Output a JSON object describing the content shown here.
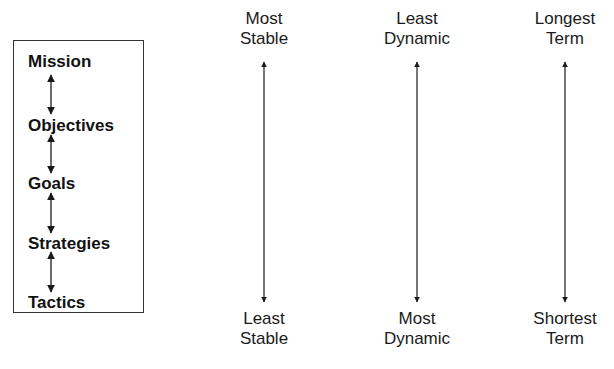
{
  "hierarchy": {
    "levels": [
      {
        "label": "Mission"
      },
      {
        "label": "Objectives"
      },
      {
        "label": "Goals"
      },
      {
        "label": "Strategies"
      },
      {
        "label": "Tactics"
      }
    ]
  },
  "scales": [
    {
      "top_line1": "Most",
      "top_line2": "Stable",
      "bottom_line1": "Least",
      "bottom_line2": "Stable"
    },
    {
      "top_line1": "Least",
      "top_line2": "Dynamic",
      "bottom_line1": "Most",
      "bottom_line2": "Dynamic"
    },
    {
      "top_line1": "Longest",
      "top_line2": "Term",
      "bottom_line1": "Shortest",
      "bottom_line2": "Term"
    }
  ],
  "colors": {
    "stroke": "#1a1a1a",
    "background": "#ffffff"
  }
}
